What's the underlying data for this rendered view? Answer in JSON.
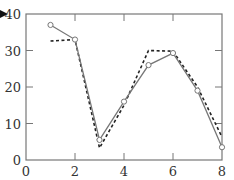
{
  "chart_data": {
    "type": "line",
    "title": "",
    "xlabel": "",
    "ylabel": "",
    "xlim": [
      0,
      8
    ],
    "ylim": [
      0,
      40
    ],
    "x_ticks": [
      0,
      2,
      4,
      6,
      8
    ],
    "y_ticks": [
      0,
      10,
      20,
      30,
      40
    ],
    "grid": false,
    "legend": null,
    "x": [
      1,
      2,
      3,
      4,
      5,
      6,
      7,
      8
    ],
    "series": [
      {
        "name": "solid-with-circle-markers",
        "style": "solid",
        "marker": "open-circle",
        "color": "#777777",
        "values": [
          37,
          33,
          5.5,
          16,
          26,
          29.3,
          19,
          3.5
        ]
      },
      {
        "name": "dashed",
        "style": "dashed",
        "marker": "none",
        "color": "#222222",
        "values": [
          32.6,
          33,
          3.3,
          15,
          30,
          29.8,
          20,
          6.3
        ]
      }
    ]
  },
  "labels": {
    "x": [
      "0",
      "2",
      "4",
      "6",
      "8"
    ],
    "y": [
      "0",
      "10",
      "20",
      "30",
      "40"
    ]
  }
}
